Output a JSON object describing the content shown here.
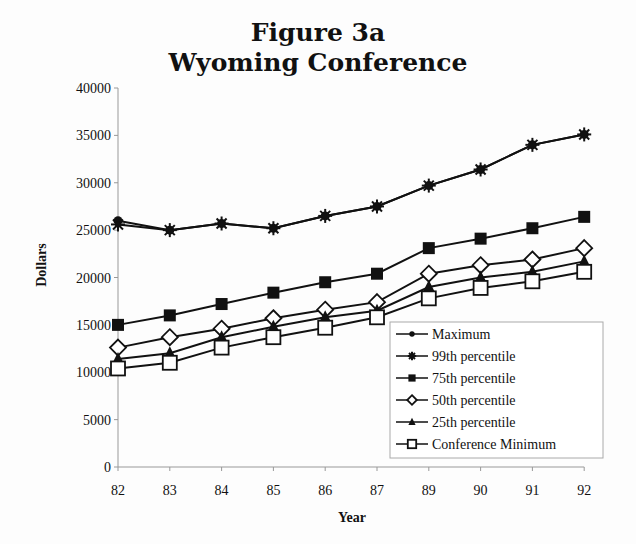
{
  "chart_data": {
    "type": "line",
    "title": "Figure 3a",
    "subtitle": "Wyoming Conference",
    "xlabel": "Year",
    "ylabel": "Dollars",
    "ylim": [
      0,
      40000
    ],
    "yticks": [
      0,
      5000,
      10000,
      15000,
      20000,
      25000,
      30000,
      35000,
      40000
    ],
    "categories": [
      "82",
      "83",
      "84",
      "85",
      "86",
      "87",
      "89",
      "90",
      "91",
      "92"
    ],
    "grid": false,
    "legend_position": "lower right, inside plot",
    "series": [
      {
        "name": "Maximum",
        "marker": "filled-circle",
        "values": [
          26000,
          25000,
          25700,
          25200,
          26500,
          27500,
          29700,
          31400,
          34000,
          35100
        ]
      },
      {
        "name": "99th percentile",
        "marker": "star",
        "values": [
          25600,
          25000,
          25700,
          25200,
          26500,
          27500,
          29700,
          31400,
          34000,
          35100
        ]
      },
      {
        "name": "75th percentile",
        "marker": "filled-square",
        "values": [
          15000,
          16000,
          17200,
          18400,
          19500,
          20400,
          23100,
          24100,
          25200,
          26400
        ]
      },
      {
        "name": "50th percentile",
        "marker": "open-diamond",
        "values": [
          12600,
          13700,
          14600,
          15700,
          16600,
          17400,
          20400,
          21300,
          21900,
          23100
        ]
      },
      {
        "name": "25th percentile",
        "marker": "filled-triangle",
        "values": [
          11400,
          12000,
          13700,
          14800,
          15800,
          16500,
          19000,
          20000,
          20600,
          21700
        ]
      },
      {
        "name": "Conference Minimum",
        "marker": "open-square",
        "values": [
          10400,
          11000,
          12600,
          13700,
          14700,
          15800,
          17800,
          18900,
          19600,
          20600
        ]
      }
    ]
  }
}
